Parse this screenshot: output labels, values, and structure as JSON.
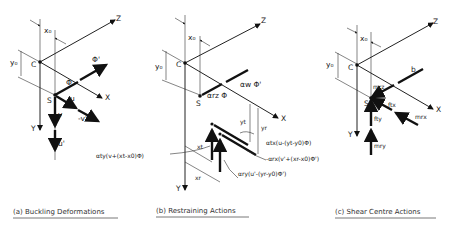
{
  "panels": [
    {
      "id": "a",
      "caption": "(a) Buckling Deformations",
      "labels": {
        "z": "Z",
        "x": "X",
        "y": "Y",
        "c": "C",
        "s": "S",
        "x0": "x₀",
        "y0": "y₀",
        "phi": "Φ",
        "phi_prime": "Φ'",
        "u": "u",
        "v": "v",
        "neg_v_prime": "-v'",
        "u_prime": "u'"
      }
    },
    {
      "id": "b",
      "caption": "(b) Restraining Actions",
      "labels": {
        "z": "Z",
        "x": "X",
        "y": "Y",
        "c": "C",
        "s": "S",
        "x0": "x₀",
        "y0": "y₀",
        "alpha_rz_phi": "αrz Φ",
        "alpha_w_phi_prime": "αw Φ'",
        "yt": "yt",
        "yr": "yr",
        "xt": "xt",
        "xr": "xr",
        "alpha_tx": "αtx(u-(yt-y0)Φ)",
        "alpha_rx": "-αrx(v'+(xr-x0)Φ')",
        "alpha_ry": "αry(u'-(yr-y0)Φ')",
        "alpha_ty": "αty(v+(xt-x0)Φ)"
      }
    },
    {
      "id": "c",
      "caption": "(c) Shear Centre Actions",
      "labels": {
        "z": "Z",
        "x": "X",
        "y": "Y",
        "c": "C",
        "s": "S",
        "x0": "x₀",
        "y0": "y₀",
        "b": "b",
        "mrz": "mrz",
        "ftx": "ftx",
        "mrx": "mrx",
        "fty": "fty",
        "mry": "mry"
      }
    }
  ]
}
